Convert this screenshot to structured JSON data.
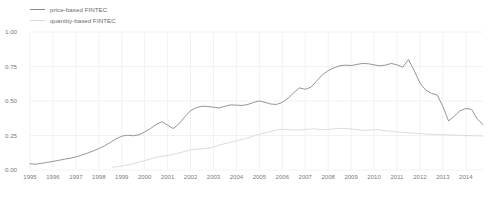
{
  "chart_data": {
    "type": "line",
    "title": "",
    "xlabel": "",
    "ylabel": "",
    "xlim": [
      1995,
      2014.75
    ],
    "ylim": [
      0.0,
      1.0
    ],
    "grid": true,
    "grid_color": "#f2f2f2",
    "background": "#ffffff",
    "legend_position": "top-left",
    "ytick_labels": [
      "0.00",
      "0.25",
      "0.50",
      "0.75",
      "1.00"
    ],
    "ytick_values": [
      0.0,
      0.25,
      0.5,
      0.75,
      1.0
    ],
    "xtick_labels": [
      "1995",
      "1996",
      "1997",
      "1998",
      "1999",
      "2000",
      "2001",
      "2002",
      "2003",
      "2004",
      "2005",
      "2006",
      "2007",
      "2008",
      "2009",
      "2010",
      "2011",
      "2012",
      "2013",
      "2014"
    ],
    "xtick_values": [
      1995,
      1996,
      1997,
      1998,
      1999,
      2000,
      2001,
      2002,
      2003,
      2004,
      2005,
      2006,
      2007,
      2008,
      2009,
      2010,
      2011,
      2012,
      2013,
      2014
    ],
    "series": [
      {
        "name": "price-based FINTEC",
        "color": "#8a8a8a",
        "width": 0.9,
        "x": [
          1995.0,
          1995.25,
          1995.5,
          1995.75,
          1996.0,
          1996.25,
          1996.5,
          1996.75,
          1997.0,
          1997.25,
          1997.5,
          1997.75,
          1998.0,
          1998.25,
          1998.5,
          1998.75,
          1999.0,
          1999.25,
          1999.5,
          1999.75,
          2000.0,
          2000.25,
          2000.5,
          2000.75,
          2001.0,
          2001.25,
          2001.5,
          2001.75,
          2002.0,
          2002.25,
          2002.5,
          2002.75,
          2003.0,
          2003.25,
          2003.5,
          2003.75,
          2004.0,
          2004.25,
          2004.5,
          2004.75,
          2005.0,
          2005.25,
          2005.5,
          2005.75,
          2006.0,
          2006.25,
          2006.5,
          2006.75,
          2007.0,
          2007.25,
          2007.5,
          2007.75,
          2008.0,
          2008.25,
          2008.5,
          2008.75,
          2009.0,
          2009.25,
          2009.5,
          2009.75,
          2010.0,
          2010.25,
          2010.5,
          2010.75,
          2011.0,
          2011.25,
          2011.5,
          2011.75,
          2012.0,
          2012.25,
          2012.5,
          2012.75,
          2013.0,
          2013.25,
          2013.5,
          2013.75,
          2014.0,
          2014.25,
          2014.5,
          2014.75
        ],
        "y": [
          0.045,
          0.042,
          0.048,
          0.055,
          0.062,
          0.07,
          0.078,
          0.085,
          0.095,
          0.108,
          0.122,
          0.138,
          0.155,
          0.175,
          0.2,
          0.225,
          0.245,
          0.252,
          0.248,
          0.255,
          0.275,
          0.3,
          0.33,
          0.35,
          0.325,
          0.3,
          0.335,
          0.385,
          0.43,
          0.452,
          0.462,
          0.46,
          0.455,
          0.45,
          0.462,
          0.472,
          0.47,
          0.468,
          0.475,
          0.49,
          0.5,
          0.49,
          0.478,
          0.475,
          0.49,
          0.52,
          0.56,
          0.595,
          0.585,
          0.6,
          0.645,
          0.69,
          0.72,
          0.74,
          0.755,
          0.76,
          0.757,
          0.765,
          0.772,
          0.77,
          0.762,
          0.755,
          0.76,
          0.772,
          0.762,
          0.745,
          0.8,
          0.72,
          0.63,
          0.58,
          0.555,
          0.545,
          0.46,
          0.355,
          0.39,
          0.43,
          0.445,
          0.44,
          0.37,
          0.33
        ],
        "notes": "rises steadily from ~0.05 (1995) to a ~0.76 plateau 2005-2007, peaks ~0.80 in 2007, then drops sharply after 2008"
      },
      {
        "name": "quantity-based FINTEC",
        "color": "#d8d8d8",
        "width": 0.9,
        "x": [
          1998.6,
          1998.85,
          1999.1,
          1999.35,
          1999.6,
          1999.85,
          2000.1,
          2000.35,
          2000.6,
          2000.85,
          2001.1,
          2001.35,
          2001.6,
          2001.85,
          2002.1,
          2002.35,
          2002.6,
          2002.85,
          2003.1,
          2003.35,
          2003.6,
          2003.85,
          2004.1,
          2004.35,
          2004.6,
          2004.85,
          2005.1,
          2005.35,
          2005.6,
          2005.85,
          2006.1,
          2006.35,
          2006.6,
          2006.85,
          2007.1,
          2007.35,
          2007.6,
          2007.85,
          2008.1,
          2008.35,
          2008.6,
          2008.85,
          2009.1,
          2009.35,
          2009.6,
          2009.85,
          2010.1,
          2010.35,
          2010.6,
          2010.85,
          2011.1,
          2011.35,
          2011.6,
          2011.85,
          2012.1,
          2012.35,
          2012.6,
          2012.85,
          2013.1,
          2013.35,
          2013.6,
          2013.85,
          2014.1,
          2014.35,
          2014.6,
          2014.75
        ],
        "y": [
          0.02,
          0.025,
          0.032,
          0.04,
          0.05,
          0.062,
          0.072,
          0.085,
          0.095,
          0.102,
          0.108,
          0.118,
          0.128,
          0.14,
          0.148,
          0.152,
          0.155,
          0.162,
          0.172,
          0.185,
          0.195,
          0.205,
          0.215,
          0.225,
          0.238,
          0.252,
          0.262,
          0.272,
          0.285,
          0.292,
          0.295,
          0.292,
          0.29,
          0.292,
          0.295,
          0.298,
          0.295,
          0.292,
          0.295,
          0.3,
          0.302,
          0.3,
          0.295,
          0.29,
          0.288,
          0.29,
          0.292,
          0.288,
          0.282,
          0.278,
          0.275,
          0.272,
          0.268,
          0.265,
          0.262,
          0.26,
          0.258,
          0.256,
          0.255,
          0.254,
          0.252,
          0.25,
          0.249,
          0.248,
          0.247,
          0.246
        ],
        "notes": "begins ~1998 near 0.02, rises smoothly to a ~0.30 plateau by 2006, then drifts gently down to ~0.25"
      }
    ]
  }
}
